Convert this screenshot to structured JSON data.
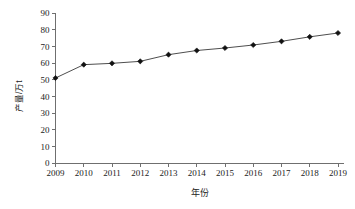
{
  "chart_data": {
    "type": "line",
    "title": "",
    "subtitle": "",
    "xlabel": "年份",
    "ylabel": "产量/万t",
    "categories": [
      "2009",
      "2010",
      "2011",
      "2012",
      "2013",
      "2014",
      "2015",
      "2016",
      "2017",
      "2018",
      "2019"
    ],
    "x": [
      2009,
      2010,
      2011,
      2012,
      2013,
      2014,
      2015,
      2016,
      2017,
      2018,
      2019
    ],
    "values": [
      51,
      59,
      59.8,
      61,
      65,
      67.5,
      69,
      70.8,
      73,
      75.7,
      78
    ],
    "series": [
      {
        "name": "产量",
        "values": [
          51,
          59,
          59.8,
          61,
          65,
          67.5,
          69,
          70.8,
          73,
          75.7,
          78
        ]
      }
    ],
    "ylim": [
      0,
      90
    ],
    "yticks": [
      0,
      10,
      20,
      30,
      40,
      50,
      60,
      70,
      80,
      90
    ],
    "ytick_labels": [
      "0",
      "10",
      "20",
      "30",
      "40",
      "50",
      "60",
      "70",
      "80",
      "90"
    ],
    "xtick_labels": [
      "2009",
      "2010",
      "2011",
      "2012",
      "2013",
      "2014",
      "2015",
      "2016",
      "2017",
      "2018",
      "2019"
    ],
    "grid": false,
    "legend": false,
    "legend_position": "none",
    "marker": "diamond",
    "line_color": "#3a3a3a",
    "marker_color": "#111111",
    "axis_color": "#6f6f6f",
    "background_color": "#ffffff"
  },
  "axis": {
    "y_title": "产量/万t",
    "x_title": "年份"
  }
}
